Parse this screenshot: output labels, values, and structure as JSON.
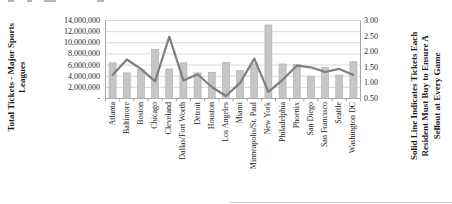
{
  "chart_data": {
    "type": "combo",
    "title": "",
    "categories": [
      "Atlanta",
      "Baltimore",
      "Boston",
      "Chicago",
      "Cleveland",
      "Dallas/Fort Worth",
      "Detroit",
      "Houston",
      "Los Angeles",
      "Miami",
      "Minneapolis/St. Paul",
      "New York",
      "Philadelphia",
      "Phoenix",
      "San Diego",
      "San Francisco",
      "Seattle",
      "Washington DC"
    ],
    "series": [
      {
        "name": "Total Tickets - Major Sports Leagues",
        "type": "bar",
        "axis": "left",
        "color": "#c6c6c6",
        "values": [
          6400000,
          4600000,
          5200000,
          8800000,
          5300000,
          6400000,
          4600000,
          4700000,
          6500000,
          5000000,
          6200000,
          13200000,
          6200000,
          6100000,
          4000000,
          5600000,
          4200000,
          6600000
        ]
      },
      {
        "name": "Solid Line Indicates Tickets Each Resident Must Buy to Ensure A Sellout at Every Game",
        "type": "line",
        "axis": "right",
        "color": "#7f7f7f",
        "values": [
          1.25,
          1.75,
          1.45,
          1.05,
          2.48,
          1.08,
          1.28,
          0.87,
          0.58,
          1.0,
          1.78,
          0.71,
          1.1,
          1.55,
          1.5,
          1.35,
          1.45,
          1.25
        ]
      }
    ],
    "left_axis": {
      "title_lines": [
        "Total Tickets - Major Sports",
        "Leagues"
      ],
      "tick_labels": [
        "14,000,000",
        "12,000,000",
        "10,000,000",
        "8,000,000",
        "6,000,000",
        "4,000,000",
        "2,000,000",
        "-"
      ],
      "tick_values": [
        14000000,
        12000000,
        10000000,
        8000000,
        6000000,
        4000000,
        2000000,
        0
      ],
      "range": [
        0,
        14000000
      ]
    },
    "right_axis": {
      "title_lines": [
        "Solid Line Indicates Tickets Each",
        "Resident Must Buy to Ensure A",
        "Sellout at Every Game"
      ],
      "tick_labels": [
        "3.00",
        "2.50",
        "2.00",
        "1.50",
        "1.00",
        "0.50"
      ],
      "tick_values": [
        3.0,
        2.5,
        2.0,
        1.5,
        1.0,
        0.5
      ],
      "range": [
        0.5,
        3.0
      ]
    },
    "gridlines": true,
    "legend_position": "none",
    "colors": {
      "bar_fill": "#c6c6c6",
      "bar_border": "#ababab",
      "line_stroke": "#7f7f7f",
      "gridline": "#d9d9d9",
      "axis_line": "#a6a6a6",
      "text": "#262626"
    }
  }
}
